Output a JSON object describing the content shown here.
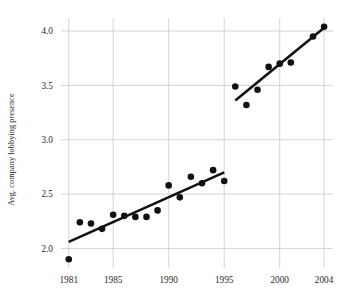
{
  "chart_data": {
    "type": "scatter",
    "title": "",
    "xlabel": "",
    "ylabel": "Avg. company lobbying presence",
    "xlim": [
      1980.3,
      2004.8
    ],
    "ylim": [
      1.82,
      4.12
    ],
    "xticks": [
      1981,
      1985,
      1990,
      1995,
      2000,
      2004
    ],
    "xtick_labels": [
      "1981",
      "1985",
      "1990",
      "1995",
      "2000",
      "2004"
    ],
    "yticks": [
      2.0,
      2.5,
      3.0,
      3.5,
      4.0
    ],
    "ytick_labels": [
      "2.0",
      "2.5",
      "3.0",
      "3.5",
      "4.0"
    ],
    "grid": true,
    "grid_color": "#c9c9c9",
    "legend": null,
    "marker_color": "#111111",
    "marker_size": 3.3,
    "trend_color": "#111111",
    "trend_width": 2.6,
    "series": [
      {
        "name": "period-1981-1995",
        "x": [
          1981,
          1982,
          1983,
          1984,
          1985,
          1986,
          1987,
          1988,
          1989,
          1990,
          1991,
          1992,
          1993,
          1994,
          1995
        ],
        "y": [
          1.9,
          2.24,
          2.23,
          2.18,
          2.31,
          2.3,
          2.29,
          2.29,
          2.35,
          2.58,
          2.47,
          2.66,
          2.6,
          2.72,
          2.62
        ],
        "trendline": {
          "x": [
            1981,
            1995
          ],
          "y": [
            2.06,
            2.7
          ]
        }
      },
      {
        "name": "period-1996-2004",
        "x": [
          1996,
          1997,
          1998,
          1999,
          2000,
          2001,
          2003,
          2004
        ],
        "y": [
          3.49,
          3.32,
          3.46,
          3.67,
          3.7,
          3.71,
          3.95,
          4.04
        ],
        "trendline": {
          "x": [
            1996,
            2004
          ],
          "y": [
            3.36,
            4.03
          ]
        }
      }
    ]
  },
  "axes": {
    "plot_left_px": 61,
    "plot_right_px": 333,
    "plot_top_px": 18,
    "plot_bottom_px": 268
  }
}
